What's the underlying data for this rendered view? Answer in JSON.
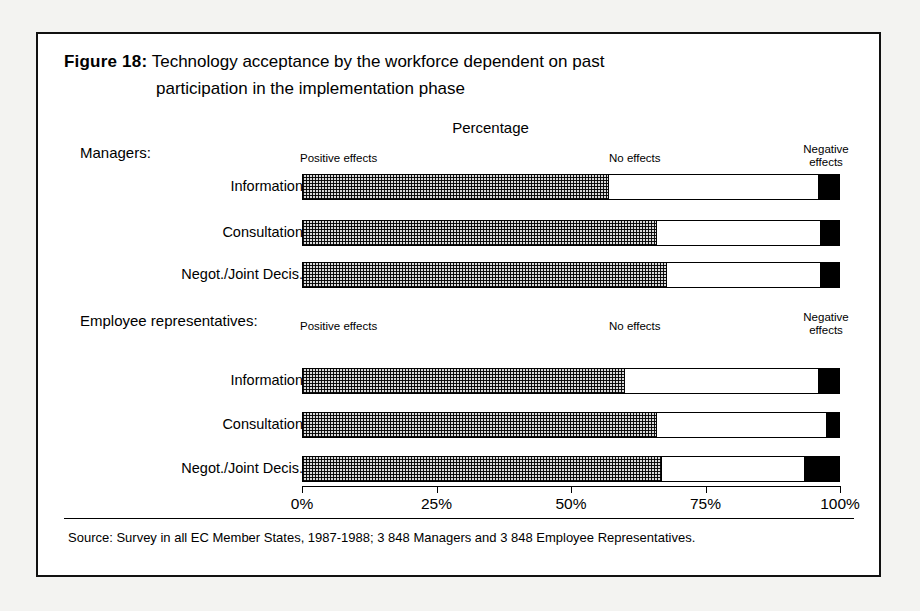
{
  "figure": {
    "label": "Figure 18:",
    "title_line1": "Technology acceptance by the workforce dependent on past",
    "title_line2": "participation in the implementation phase",
    "axis_caption": "Percentage",
    "source": "Source: Survey in all EC Member States, 1987-1988; 3 848 Managers and 3 848 Employee Representatives."
  },
  "legend": {
    "positive": "Positive effects",
    "none": "No effects",
    "negative_line1": "Negative",
    "negative_line2": "effects"
  },
  "groups": [
    {
      "heading": "Managers:"
    },
    {
      "heading": "Employee representatives:"
    }
  ],
  "axis": {
    "ticks": [
      "0%",
      "25%",
      "50%",
      "75%",
      "100%"
    ],
    "tick_values": [
      0,
      25,
      50,
      75,
      100
    ]
  },
  "chart_data": {
    "type": "bar",
    "orientation": "horizontal",
    "stacked": true,
    "title": "Technology acceptance by the workforce dependent on past participation in the implementation phase",
    "xlabel": "Percentage",
    "ylabel": "",
    "xlim": [
      0,
      100
    ],
    "grid": false,
    "legend_position": "above-bars",
    "series": [
      {
        "name": "Positive effects",
        "fill": "checkerboard-grey"
      },
      {
        "name": "No effects",
        "fill": "white"
      },
      {
        "name": "Negative effects",
        "fill": "black"
      }
    ],
    "groups": [
      {
        "name": "Managers:",
        "categories": [
          "Information",
          "Consultation",
          "Negot./Joint Decis."
        ],
        "values": [
          {
            "positive": 57,
            "none": 39,
            "negative": 4
          },
          {
            "positive": 66,
            "none": 30.5,
            "negative": 3.5
          },
          {
            "positive": 68,
            "none": 28.5,
            "negative": 3.5
          }
        ]
      },
      {
        "name": "Employee representatives:",
        "categories": [
          "Information",
          "Consultation",
          "Negot./Joint Decis."
        ],
        "values": [
          {
            "positive": 60,
            "none": 36,
            "negative": 4
          },
          {
            "positive": 66,
            "none": 31.5,
            "negative": 2.5
          },
          {
            "positive": 67,
            "none": 26.5,
            "negative": 6.5
          }
        ]
      }
    ]
  }
}
